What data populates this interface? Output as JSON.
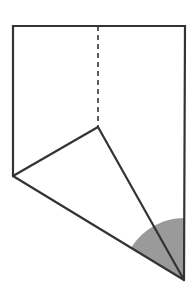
{
  "diagram": {
    "colors": {
      "background": "#ffffff",
      "stroke": "#333333",
      "shaded_angle": "#9a9a9a"
    },
    "points": {
      "top_left": [
        13,
        26
      ],
      "top_right": [
        185,
        26
      ],
      "top_mid": [
        98,
        26
      ],
      "apex": [
        98,
        127
      ],
      "left_vertex": [
        13,
        176
      ],
      "bottom_right": [
        184,
        280
      ]
    },
    "shaded_angle_radius": 62,
    "labels": []
  }
}
